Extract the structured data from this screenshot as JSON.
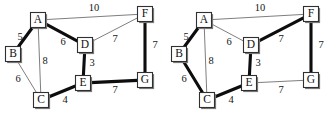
{
  "figure": {
    "title": "",
    "background_color": "#ffffff",
    "thin_edge_color": "#6f6f6f",
    "thick_edge_color": "#0d0d0d",
    "node_fill_color": "#ffffff",
    "node_border_color": "#303030"
  },
  "chart_data": {
    "type": "diagram",
    "title": "",
    "xlabel": "",
    "ylabel": "",
    "panels": [
      {
        "panel_id": "left",
        "nodes": [
          {
            "id": "A",
            "label": "A",
            "x": 38,
            "y": 20
          },
          {
            "id": "B",
            "label": "B",
            "x": 13,
            "y": 54
          },
          {
            "id": "C",
            "label": "C",
            "x": 41,
            "y": 100
          },
          {
            "id": "D",
            "label": "D",
            "x": 85,
            "y": 45
          },
          {
            "id": "E",
            "label": "E",
            "x": 83,
            "y": 83
          },
          {
            "id": "F",
            "label": "F",
            "x": 145,
            "y": 14
          },
          {
            "id": "G",
            "label": "G",
            "x": 145,
            "y": 80
          }
        ],
        "edges": [
          {
            "from": "A",
            "to": "B",
            "weight": 5,
            "highlighted": true,
            "label_x": 20,
            "label_y": 38
          },
          {
            "from": "A",
            "to": "C",
            "weight": 8,
            "highlighted": false,
            "label_x": 45,
            "label_y": 62
          },
          {
            "from": "A",
            "to": "D",
            "weight": 6,
            "highlighted": true,
            "label_x": 63,
            "label_y": 43
          },
          {
            "from": "A",
            "to": "F",
            "weight": 10,
            "highlighted": false,
            "label_x": 94,
            "label_y": 9
          },
          {
            "from": "B",
            "to": "C",
            "weight": 6,
            "highlighted": false,
            "label_x": 18,
            "label_y": 80
          },
          {
            "from": "C",
            "to": "E",
            "weight": 4,
            "highlighted": true,
            "label_x": 65,
            "label_y": 101
          },
          {
            "from": "D",
            "to": "E",
            "weight": 3,
            "highlighted": true,
            "label_x": 92,
            "label_y": 64
          },
          {
            "from": "D",
            "to": "F",
            "weight": 7,
            "highlighted": false,
            "label_x": 115,
            "label_y": 40
          },
          {
            "from": "E",
            "to": "G",
            "weight": 7,
            "highlighted": true,
            "label_x": 115,
            "label_y": 91
          },
          {
            "from": "F",
            "to": "G",
            "weight": 7,
            "highlighted": true,
            "label_x": 155,
            "label_y": 46
          }
        ]
      },
      {
        "panel_id": "right",
        "x_offset": 166,
        "nodes": [
          {
            "id": "A",
            "label": "A",
            "x": 38,
            "y": 20
          },
          {
            "id": "B",
            "label": "B",
            "x": 13,
            "y": 54
          },
          {
            "id": "C",
            "label": "C",
            "x": 41,
            "y": 100
          },
          {
            "id": "D",
            "label": "D",
            "x": 85,
            "y": 45
          },
          {
            "id": "E",
            "label": "E",
            "x": 83,
            "y": 83
          },
          {
            "id": "F",
            "label": "F",
            "x": 145,
            "y": 14
          },
          {
            "id": "G",
            "label": "G",
            "x": 145,
            "y": 80
          }
        ],
        "edges": [
          {
            "from": "A",
            "to": "B",
            "weight": 5,
            "highlighted": true,
            "label_x": 20,
            "label_y": 38
          },
          {
            "from": "A",
            "to": "C",
            "weight": 8,
            "highlighted": false,
            "label_x": 45,
            "label_y": 62
          },
          {
            "from": "A",
            "to": "D",
            "weight": 6,
            "highlighted": false,
            "label_x": 63,
            "label_y": 43
          },
          {
            "from": "A",
            "to": "F",
            "weight": 10,
            "highlighted": false,
            "label_x": 94,
            "label_y": 9
          },
          {
            "from": "B",
            "to": "C",
            "weight": 6,
            "highlighted": true,
            "label_x": 18,
            "label_y": 80
          },
          {
            "from": "C",
            "to": "E",
            "weight": 4,
            "highlighted": true,
            "label_x": 65,
            "label_y": 101
          },
          {
            "from": "D",
            "to": "E",
            "weight": 3,
            "highlighted": true,
            "label_x": 92,
            "label_y": 64
          },
          {
            "from": "D",
            "to": "F",
            "weight": 7,
            "highlighted": true,
            "label_x": 115,
            "label_y": 40
          },
          {
            "from": "E",
            "to": "G",
            "weight": 7,
            "highlighted": false,
            "label_x": 115,
            "label_y": 91
          },
          {
            "from": "F",
            "to": "G",
            "weight": 7,
            "highlighted": true,
            "label_x": 155,
            "label_y": 46
          }
        ]
      }
    ]
  }
}
